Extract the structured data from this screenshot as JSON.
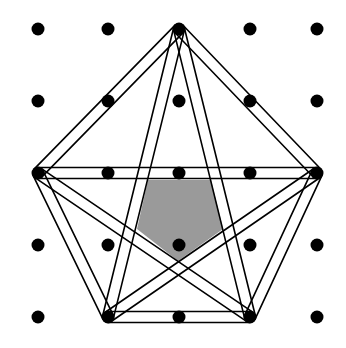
{
  "diagram": {
    "title": "",
    "grid": {
      "xs": [
        38,
        108,
        179,
        250,
        317
      ],
      "ys": [
        29,
        101,
        173,
        245,
        317
      ],
      "dot_radius": 6.5,
      "dot_color": "#000000"
    },
    "pentagon_vertices": [
      {
        "id": "top",
        "x": 179,
        "y": 29
      },
      {
        "id": "right",
        "x": 317,
        "y": 173
      },
      {
        "id": "bottom-right",
        "x": 250,
        "y": 317
      },
      {
        "id": "bottom-left",
        "x": 108,
        "y": 317
      },
      {
        "id": "left",
        "x": 38,
        "y": 173
      }
    ],
    "strip_width": 11,
    "line_color": "#000000",
    "line_width": 1.6,
    "edges": [
      [
        "top",
        "right"
      ],
      [
        "right",
        "bottom-right"
      ],
      [
        "bottom-right",
        "bottom-left"
      ],
      [
        "bottom-left",
        "left"
      ],
      [
        "left",
        "top"
      ],
      [
        "top",
        "bottom-right"
      ],
      [
        "top",
        "bottom-left"
      ],
      [
        "left",
        "right"
      ],
      [
        "left",
        "bottom-right"
      ],
      [
        "right",
        "bottom-left"
      ]
    ],
    "shaded_region": {
      "points": [
        [
          148,
          180
        ],
        [
          211,
          180
        ],
        [
          223,
          229
        ],
        [
          178,
          261
        ],
        [
          137,
          229
        ]
      ],
      "fill": "#9a9a9a"
    }
  }
}
